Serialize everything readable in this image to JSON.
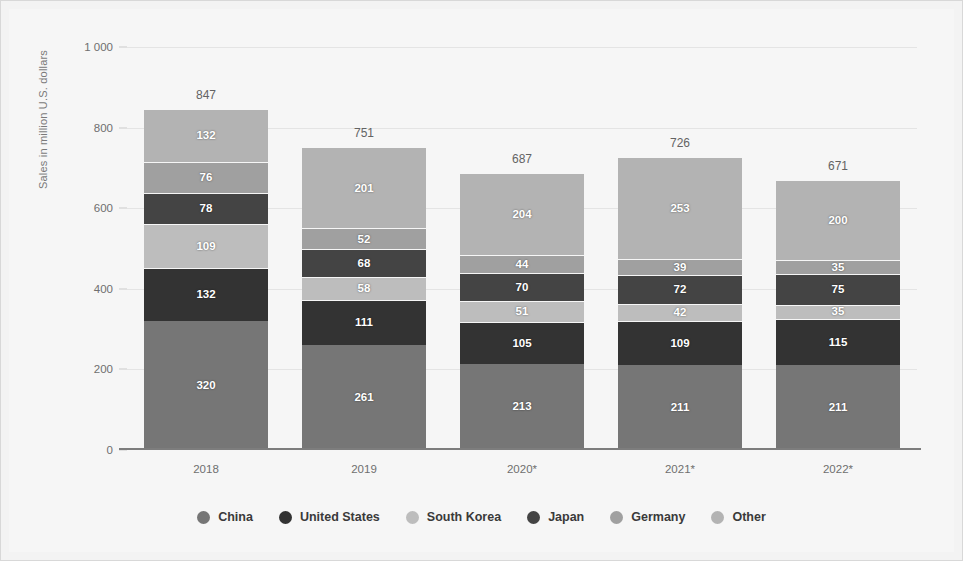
{
  "chart_data": {
    "type": "bar",
    "stacked": true,
    "title": "",
    "xlabel": "",
    "ylabel": "Sales in million U.S. dollars",
    "categories": [
      "2018",
      "2019",
      "2020*",
      "2021*",
      "2022*"
    ],
    "ylim": [
      0,
      1000
    ],
    "yticks": [
      "0",
      "200",
      "400",
      "600",
      "800",
      "1 000"
    ],
    "ytick_values": [
      0,
      200,
      400,
      600,
      800,
      1000
    ],
    "grid": true,
    "legend_position": "bottom",
    "series": [
      {
        "name": "China",
        "color": "#767676",
        "values": [
          320,
          261,
          213,
          211,
          211
        ]
      },
      {
        "name": "United States",
        "color": "#333333",
        "values": [
          132,
          111,
          105,
          109,
          115
        ]
      },
      {
        "name": "South Korea",
        "color": "#bdbdbd",
        "values": [
          109,
          58,
          51,
          42,
          35
        ]
      },
      {
        "name": "Japan",
        "color": "#444444",
        "values": [
          78,
          68,
          70,
          72,
          75
        ]
      },
      {
        "name": "Germany",
        "color": "#a0a0a0",
        "values": [
          76,
          52,
          44,
          39,
          35
        ]
      },
      {
        "name": "Other",
        "color": "#b3b3b3",
        "values": [
          132,
          201,
          204,
          253,
          200
        ]
      }
    ],
    "totals": [
      847,
      751,
      687,
      726,
      671
    ]
  }
}
